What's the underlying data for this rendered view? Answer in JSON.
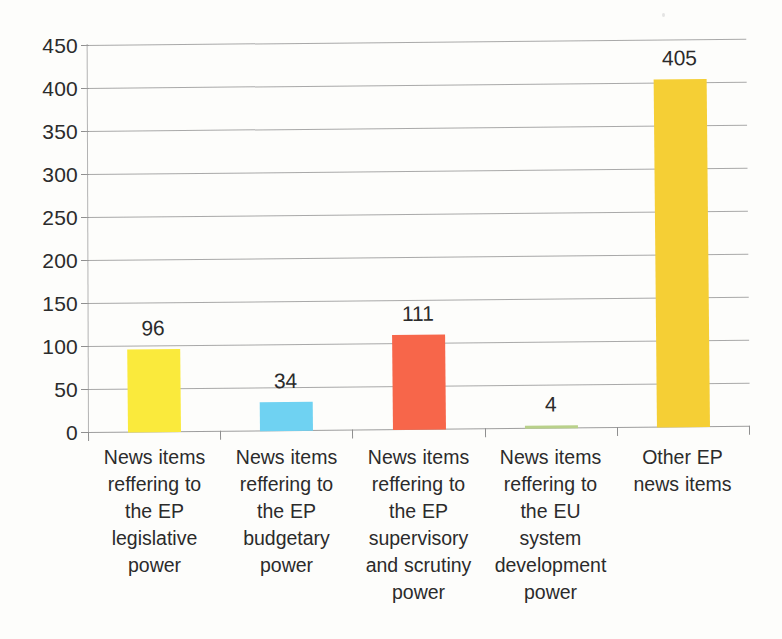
{
  "chart_data": {
    "type": "bar",
    "title": "",
    "subtitle": "",
    "xlabel": "",
    "ylabel": "",
    "ylim": [
      0,
      450
    ],
    "ytick_step": 50,
    "yticks": [
      450,
      400,
      350,
      300,
      250,
      200,
      150,
      100,
      50,
      0
    ],
    "grid": true,
    "legend": false,
    "legend_position": "none",
    "categories": [
      "News items reffering to the EP legislative power",
      "News items reffering to the EP budgetary power",
      "News items reffering to the EP supervisory and scrutiny power",
      "News items reffering to the EU system development power",
      "Other EP news items"
    ],
    "category_lines": [
      [
        "News items",
        "reffering to",
        "the EP",
        "legislative",
        "power"
      ],
      [
        "News items",
        "reffering to",
        "the EP",
        "budgetary",
        "power"
      ],
      [
        "News items",
        "reffering to",
        "the EP",
        "supervisory",
        "and scrutiny",
        "power"
      ],
      [
        "News items",
        "reffering to",
        "the EU",
        "system",
        "development",
        "power"
      ],
      [
        "Other EP",
        "news items"
      ]
    ],
    "values": [
      96,
      34,
      111,
      4,
      405
    ],
    "data_labels": [
      "96",
      "34",
      "111",
      "4",
      "405"
    ],
    "bar_colors": [
      "#faea3c",
      "#6fd2f2",
      "#f7664a",
      "#b9d18a",
      "#f5cf35"
    ],
    "axis_color": "#8f8f8f",
    "grid_color": "#9a9a9a",
    "text_color": "#2b2b2b",
    "background": "#fdfdfb"
  }
}
